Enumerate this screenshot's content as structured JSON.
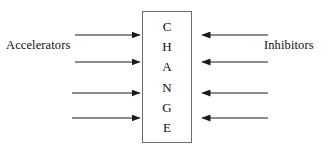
{
  "diagram": {
    "type": "force-field-analysis",
    "center_box": {
      "label": "CHANGE",
      "letters": [
        "C",
        "H",
        "A",
        "N",
        "G",
        "E"
      ],
      "border_color": "#6d6d6d",
      "fill_color": "#ffffff",
      "x": 142,
      "y": 11,
      "width": 50,
      "height": 132
    },
    "left_label": "Accelerators",
    "right_label": "Inhibitors",
    "arrow_color": "#1a1a1a",
    "text_color": "#101010",
    "left_arrows": [
      {
        "x1": 75,
        "y": 35,
        "x2": 140,
        "direction": "right"
      },
      {
        "x1": 75,
        "y": 62,
        "x2": 140,
        "direction": "right"
      },
      {
        "x1": 72,
        "y": 93,
        "x2": 140,
        "direction": "right"
      },
      {
        "x1": 72,
        "y": 118,
        "x2": 140,
        "direction": "right"
      }
    ],
    "right_arrows": [
      {
        "x1": 268,
        "y": 35,
        "x2": 202,
        "direction": "left"
      },
      {
        "x1": 268,
        "y": 62,
        "x2": 202,
        "direction": "left"
      },
      {
        "x1": 268,
        "y": 93,
        "x2": 202,
        "direction": "left"
      },
      {
        "x1": 268,
        "y": 118,
        "x2": 202,
        "direction": "left"
      }
    ]
  }
}
